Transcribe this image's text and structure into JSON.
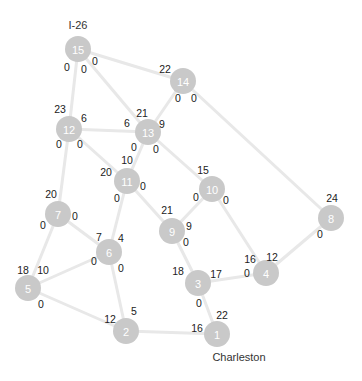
{
  "colors": {
    "background": "#ffffff",
    "edge": "#e8e8e8",
    "node_fill": "#c9c9c9",
    "node_text": "#ffffff",
    "label_text": "#222222"
  },
  "nodes": [
    {
      "id": "1",
      "x": 217,
      "y": 334
    },
    {
      "id": "2",
      "x": 126,
      "y": 331
    },
    {
      "id": "3",
      "x": 198,
      "y": 283
    },
    {
      "id": "4",
      "x": 266,
      "y": 273
    },
    {
      "id": "5",
      "x": 28,
      "y": 288
    },
    {
      "id": "6",
      "x": 109,
      "y": 252
    },
    {
      "id": "7",
      "x": 58,
      "y": 214
    },
    {
      "id": "8",
      "x": 331,
      "y": 218
    },
    {
      "id": "9",
      "x": 172,
      "y": 231
    },
    {
      "id": "10",
      "x": 212,
      "y": 189
    },
    {
      "id": "11",
      "x": 127,
      "y": 181
    },
    {
      "id": "12",
      "x": 69,
      "y": 129
    },
    {
      "id": "13",
      "x": 148,
      "y": 132
    },
    {
      "id": "14",
      "x": 183,
      "y": 81
    },
    {
      "id": "15",
      "x": 78,
      "y": 49
    }
  ],
  "edges": [
    [
      "15",
      "12"
    ],
    [
      "15",
      "13"
    ],
    [
      "15",
      "14"
    ],
    [
      "14",
      "13"
    ],
    [
      "14",
      "8"
    ],
    [
      "12",
      "13"
    ],
    [
      "12",
      "11"
    ],
    [
      "12",
      "7"
    ],
    [
      "13",
      "11"
    ],
    [
      "13",
      "10"
    ],
    [
      "11",
      "6"
    ],
    [
      "11",
      "9"
    ],
    [
      "10",
      "9"
    ],
    [
      "10",
      "4"
    ],
    [
      "8",
      "4"
    ],
    [
      "7",
      "6"
    ],
    [
      "7",
      "5"
    ],
    [
      "6",
      "5"
    ],
    [
      "6",
      "2"
    ],
    [
      "9",
      "3"
    ],
    [
      "3",
      "4"
    ],
    [
      "3",
      "1"
    ],
    [
      "5",
      "2"
    ],
    [
      "2",
      "1"
    ]
  ],
  "edge_labels": [
    {
      "text": "0",
      "x": 67,
      "y": 67
    },
    {
      "text": "0",
      "x": 84,
      "y": 69
    },
    {
      "text": "0",
      "x": 95,
      "y": 61
    },
    {
      "text": "22",
      "x": 165,
      "y": 69
    },
    {
      "text": "0",
      "x": 178,
      "y": 98
    },
    {
      "text": "0",
      "x": 194,
      "y": 98
    },
    {
      "text": "23",
      "x": 60,
      "y": 109
    },
    {
      "text": "6",
      "x": 84,
      "y": 118
    },
    {
      "text": "0",
      "x": 59,
      "y": 144
    },
    {
      "text": "0",
      "x": 80,
      "y": 144
    },
    {
      "text": "21",
      "x": 142,
      "y": 113
    },
    {
      "text": "6",
      "x": 127,
      "y": 123
    },
    {
      "text": "9",
      "x": 162,
      "y": 124
    },
    {
      "text": "0",
      "x": 134,
      "y": 147
    },
    {
      "text": "0",
      "x": 156,
      "y": 149
    },
    {
      "text": "10",
      "x": 127,
      "y": 160
    },
    {
      "text": "20",
      "x": 106,
      "y": 172
    },
    {
      "text": "0",
      "x": 143,
      "y": 186
    },
    {
      "text": "15",
      "x": 203,
      "y": 170
    },
    {
      "text": "0",
      "x": 196,
      "y": 197
    },
    {
      "text": "0",
      "x": 226,
      "y": 200
    },
    {
      "text": "24",
      "x": 332,
      "y": 198
    },
    {
      "text": "0",
      "x": 320,
      "y": 234
    },
    {
      "text": "20",
      "x": 51,
      "y": 194
    },
    {
      "text": "0",
      "x": 75,
      "y": 216
    },
    {
      "text": "0",
      "x": 43,
      "y": 225
    },
    {
      "text": "21",
      "x": 167,
      "y": 210
    },
    {
      "text": "9",
      "x": 189,
      "y": 226
    },
    {
      "text": "0",
      "x": 186,
      "y": 242
    },
    {
      "text": "0",
      "x": 117,
      "y": 198
    },
    {
      "text": "7",
      "x": 99,
      "y": 237
    },
    {
      "text": "4",
      "x": 121,
      "y": 238
    },
    {
      "text": "0",
      "x": 94,
      "y": 261
    },
    {
      "text": "0",
      "x": 121,
      "y": 268
    },
    {
      "text": "16",
      "x": 250,
      "y": 259
    },
    {
      "text": "12",
      "x": 272,
      "y": 257
    },
    {
      "text": "0",
      "x": 247,
      "y": 273
    },
    {
      "text": "18",
      "x": 178,
      "y": 271
    },
    {
      "text": "17",
      "x": 216,
      "y": 274
    },
    {
      "text": "0",
      "x": 199,
      "y": 303
    },
    {
      "text": "18",
      "x": 23,
      "y": 270
    },
    {
      "text": "10",
      "x": 43,
      "y": 270
    },
    {
      "text": "0",
      "x": 41,
      "y": 304
    },
    {
      "text": "5",
      "x": 134,
      "y": 311
    },
    {
      "text": "12",
      "x": 110,
      "y": 319
    },
    {
      "text": "22",
      "x": 222,
      "y": 315
    },
    {
      "text": "16",
      "x": 197,
      "y": 328
    }
  ],
  "place_labels": [
    {
      "text": "I-26",
      "x": 78,
      "y": 25
    },
    {
      "text": "Charleston",
      "x": 239,
      "y": 357
    }
  ]
}
